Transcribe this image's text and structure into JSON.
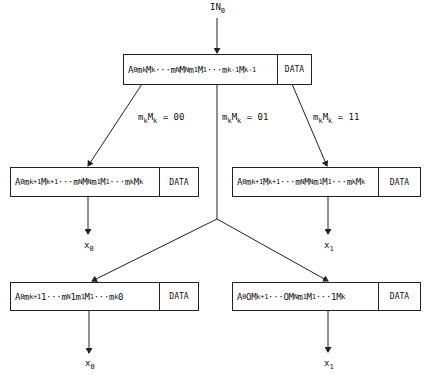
{
  "input_label": {
    "base": "IN",
    "sub": "0"
  },
  "top_register": {
    "segments": [
      {
        "t": "A"
      },
      {
        "s": "0"
      },
      {
        "t": "m"
      },
      {
        "s": "k"
      },
      {
        "t": "M"
      },
      {
        "s": "k"
      },
      {
        "t": "···m"
      },
      {
        "s": "N"
      },
      {
        "t": "M"
      },
      {
        "s": "N"
      },
      {
        "t": "m"
      },
      {
        "s": "1"
      },
      {
        "t": "M"
      },
      {
        "s": "1"
      },
      {
        "t": "···m"
      },
      {
        "s": "k-1"
      },
      {
        "t": "M"
      },
      {
        "s": "k-1"
      }
    ],
    "data_label": "DATA"
  },
  "branch_labels": [
    {
      "id": "left",
      "base": "m",
      "sub1": "k",
      "mid": "M",
      "sub2": "k",
      "value": " = 00"
    },
    {
      "id": "center",
      "base": "m",
      "sub1": "k",
      "mid": "M",
      "sub2": "k",
      "value": " = 01"
    },
    {
      "id": "right",
      "base": "m",
      "sub1": "k",
      "mid": "M",
      "sub2": "k",
      "value": " = 11"
    }
  ],
  "mid_left_register": {
    "segments": [
      {
        "t": "A"
      },
      {
        "s": "0"
      },
      {
        "t": "m"
      },
      {
        "s": "k+1"
      },
      {
        "t": "M"
      },
      {
        "s": "k+1"
      },
      {
        "t": "···m"
      },
      {
        "s": "N"
      },
      {
        "t": "M"
      },
      {
        "s": "N"
      },
      {
        "t": "m"
      },
      {
        "s": "1"
      },
      {
        "t": "M"
      },
      {
        "s": "1"
      },
      {
        "t": "···m"
      },
      {
        "s": "k"
      },
      {
        "t": "M"
      },
      {
        "s": "k"
      }
    ],
    "data_label": "DATA",
    "output": {
      "base": "x",
      "sub": "0"
    }
  },
  "mid_right_register": {
    "segments": [
      {
        "t": "A"
      },
      {
        "s": "0"
      },
      {
        "t": "m"
      },
      {
        "s": "k+1"
      },
      {
        "t": "M"
      },
      {
        "s": "k+1"
      },
      {
        "t": "···m"
      },
      {
        "s": "N"
      },
      {
        "t": "M"
      },
      {
        "s": "N"
      },
      {
        "t": "m"
      },
      {
        "s": "1"
      },
      {
        "t": "M"
      },
      {
        "s": "1"
      },
      {
        "t": "···m"
      },
      {
        "s": "k"
      },
      {
        "t": "M"
      },
      {
        "s": "k"
      }
    ],
    "data_label": "DATA",
    "output": {
      "base": "x",
      "sub": "1"
    }
  },
  "bottom_left_register": {
    "segments": [
      {
        "t": "A"
      },
      {
        "s": "0"
      },
      {
        "t": "m"
      },
      {
        "s": "k+1"
      },
      {
        "t": "1···m"
      },
      {
        "s": "N"
      },
      {
        "t": "1m"
      },
      {
        "s": "1"
      },
      {
        "t": "M"
      },
      {
        "s": "1"
      },
      {
        "t": "···m"
      },
      {
        "s": "k"
      },
      {
        "t": "0"
      }
    ],
    "data_label": "DATA",
    "output": {
      "base": "x",
      "sub": "0"
    }
  },
  "bottom_right_register": {
    "segments": [
      {
        "t": "A"
      },
      {
        "s": "0"
      },
      {
        "t": "OM"
      },
      {
        "s": "k+1"
      },
      {
        "t": "···OM"
      },
      {
        "s": "N"
      },
      {
        "t": "m"
      },
      {
        "s": "1"
      },
      {
        "t": "M"
      },
      {
        "s": "1"
      },
      {
        "t": "···1M"
      },
      {
        "s": "k"
      }
    ],
    "data_label": "DATA",
    "output": {
      "base": "x",
      "sub": "1"
    }
  },
  "colors": {
    "line": "#222222",
    "background": "#ffffff"
  }
}
